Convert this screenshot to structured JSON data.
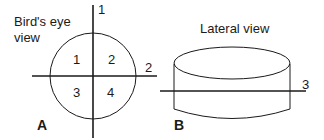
{
  "panel_a": {
    "letter": "A",
    "title_line1": "Bird's eye",
    "title_line2": "view",
    "axis_labels": {
      "vertical": "1",
      "horizontal": "2"
    },
    "quadrants": [
      "1",
      "2",
      "3",
      "4"
    ]
  },
  "panel_b": {
    "letter": "B",
    "title": "Lateral view",
    "axis_label": "3"
  },
  "colors": {
    "stroke": "#1a1a1a",
    "background": "#ffffff"
  }
}
